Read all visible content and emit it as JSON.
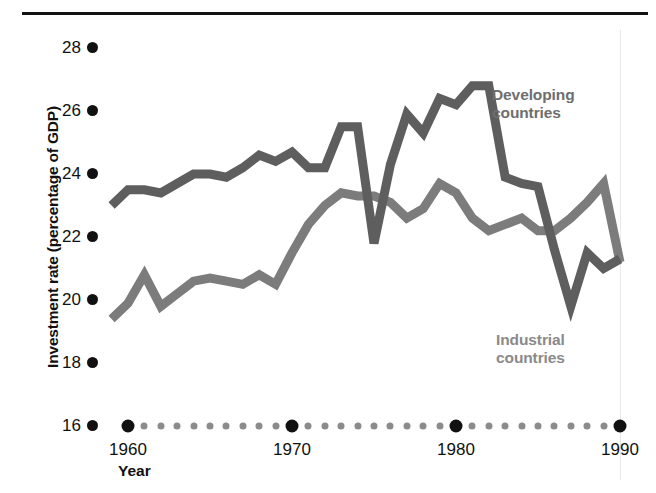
{
  "chart_data": {
    "type": "line",
    "title": "",
    "xlabel": "Year",
    "ylabel": "Investment rate (percentage of GDP)",
    "xlim": [
      1958,
      1990
    ],
    "ylim": [
      16,
      28
    ],
    "grid": false,
    "legend_position": "inline-annotation",
    "y_ticks": [
      28,
      26,
      24,
      22,
      20,
      18,
      16
    ],
    "y_tick_labels": [
      "28",
      "26",
      "24",
      "22",
      "20",
      "18",
      "16"
    ],
    "x_major_ticks": [
      1960,
      1970,
      1980,
      1990
    ],
    "x_major_tick_labels": [
      "1960",
      "1970",
      "1980",
      "1990"
    ],
    "x_minor_ticks": [
      1961,
      1962,
      1963,
      1964,
      1965,
      1966,
      1967,
      1968,
      1969,
      1971,
      1972,
      1973,
      1974,
      1975,
      1976,
      1977,
      1978,
      1979,
      1981,
      1982,
      1983,
      1984,
      1985,
      1986,
      1987,
      1988,
      1989
    ],
    "x": [
      1959,
      1960,
      1961,
      1962,
      1963,
      1964,
      1965,
      1966,
      1967,
      1968,
      1969,
      1970,
      1971,
      1972,
      1973,
      1974,
      1975,
      1976,
      1977,
      1978,
      1979,
      1980,
      1981,
      1982,
      1983,
      1984,
      1985,
      1986,
      1987,
      1988,
      1989,
      1990
    ],
    "series": [
      {
        "name": "Developing countries",
        "color": "#5e5e5e",
        "values": [
          23.0,
          23.5,
          23.5,
          23.4,
          23.7,
          24.0,
          24.0,
          23.9,
          24.2,
          24.6,
          24.4,
          24.7,
          24.2,
          24.2,
          25.5,
          25.5,
          21.8,
          24.3,
          25.9,
          25.3,
          26.4,
          26.2,
          26.8,
          26.8,
          23.9,
          23.7,
          23.6,
          21.6,
          19.8,
          21.5,
          21.0,
          21.3
        ]
      },
      {
        "name": "Industrial countries",
        "color": "#7c7c7c",
        "values": [
          19.4,
          19.9,
          20.8,
          19.8,
          20.2,
          20.6,
          20.7,
          20.6,
          20.5,
          20.8,
          20.5,
          21.5,
          22.4,
          23.0,
          23.4,
          23.3,
          23.3,
          23.1,
          22.6,
          22.9,
          23.7,
          23.4,
          22.6,
          22.2,
          22.4,
          22.6,
          22.2,
          22.2,
          22.6,
          23.1,
          23.7,
          21.2
        ]
      }
    ],
    "annotations": [
      {
        "text": "Developing\ncountries",
        "x": 1987,
        "y": 26.0,
        "color": "#6e6e6e"
      },
      {
        "text": "Industrial\ncountries",
        "x": 1984,
        "y": 18.8,
        "color": "#8a8a8a"
      }
    ]
  },
  "axes": {
    "y_title": "Investment rate (percentage of GDP)",
    "x_title": "Year"
  },
  "labels": {
    "developing": "Developing\ncountries",
    "industrial": "Industrial\ncountries"
  },
  "colors": {
    "developing_line": "#5e5e5e",
    "industrial_line": "#7c7c7c",
    "axis_text": "#111111",
    "tick_minor": "#8b8b8b",
    "rule": "#121212"
  }
}
